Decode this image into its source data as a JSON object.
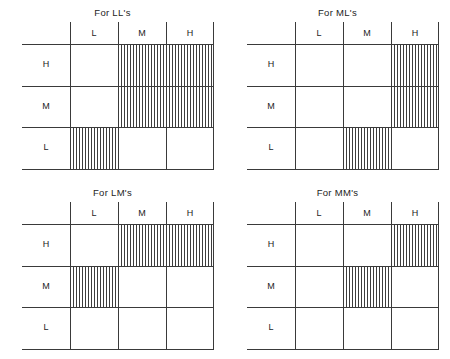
{
  "figure": {
    "column_axis_labels": [
      "L",
      "M",
      "H"
    ],
    "row_axis_labels": [
      "H",
      "M",
      "L"
    ]
  },
  "footer": {
    "text": ""
  },
  "chart_data": [
    {
      "type": "heatmap",
      "title": "For LL's",
      "panel": "top-left",
      "xlabel": "",
      "ylabel": "",
      "categories": [
        "L",
        "M",
        "H"
      ],
      "rows": [
        "H",
        "M",
        "L"
      ],
      "legend": "hatched = selected region",
      "grid": true,
      "values": [
        [
          0,
          1,
          1
        ],
        [
          0,
          1,
          1
        ],
        [
          1,
          0,
          0
        ]
      ]
    },
    {
      "type": "heatmap",
      "title": "For ML's",
      "panel": "top-right",
      "xlabel": "",
      "ylabel": "",
      "categories": [
        "L",
        "M",
        "H"
      ],
      "rows": [
        "H",
        "M",
        "L"
      ],
      "legend": "hatched = selected region",
      "grid": true,
      "values": [
        [
          0,
          0,
          1
        ],
        [
          0,
          0,
          1
        ],
        [
          0,
          1,
          0
        ]
      ]
    },
    {
      "type": "heatmap",
      "title": "For LM's",
      "panel": "bottom-left",
      "xlabel": "",
      "ylabel": "",
      "categories": [
        "L",
        "M",
        "H"
      ],
      "rows": [
        "H",
        "M",
        "L"
      ],
      "legend": "hatched = selected region",
      "grid": true,
      "values": [
        [
          0,
          1,
          1
        ],
        [
          1,
          0,
          0
        ],
        [
          0,
          0,
          0
        ]
      ]
    },
    {
      "type": "heatmap",
      "title": "For MM's",
      "panel": "bottom-right",
      "xlabel": "",
      "ylabel": "",
      "categories": [
        "L",
        "M",
        "H"
      ],
      "rows": [
        "H",
        "M",
        "L"
      ],
      "legend": "hatched = selected region",
      "grid": true,
      "values": [
        [
          0,
          0,
          1
        ],
        [
          0,
          1,
          0
        ],
        [
          0,
          0,
          0
        ]
      ]
    }
  ]
}
